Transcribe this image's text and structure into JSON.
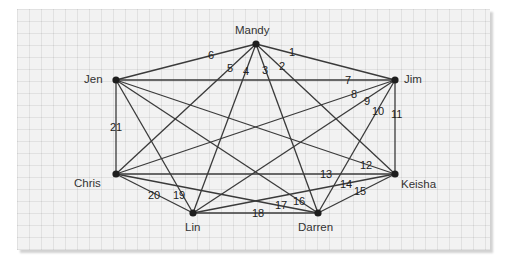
{
  "diagram": {
    "type": "weighted-complete-graph",
    "nodes": [
      {
        "id": "mandy",
        "label": "Mandy",
        "x": 256,
        "y": 44,
        "lx": 235,
        "ly": 34
      },
      {
        "id": "jen",
        "label": "Jen",
        "x": 116,
        "y": 80,
        "lx": 84,
        "ly": 83
      },
      {
        "id": "jim",
        "label": "Jim",
        "x": 395,
        "y": 80,
        "lx": 404,
        "ly": 83
      },
      {
        "id": "chris",
        "label": "Chris",
        "x": 116,
        "y": 174,
        "lx": 74,
        "ly": 187
      },
      {
        "id": "keisha",
        "label": "Keisha",
        "x": 395,
        "y": 174,
        "lx": 401,
        "ly": 188
      },
      {
        "id": "lin",
        "label": "Lin",
        "x": 193,
        "y": 213,
        "lx": 185,
        "ly": 231
      },
      {
        "id": "darren",
        "label": "Darren",
        "x": 318,
        "y": 213,
        "lx": 298,
        "ly": 231
      }
    ],
    "edges": [
      {
        "label": "1",
        "from": "mandy",
        "to": "jim",
        "lx": 289,
        "ly": 56
      },
      {
        "label": "2",
        "from": "mandy",
        "to": "keisha",
        "lx": 279,
        "ly": 70
      },
      {
        "label": "3",
        "from": "mandy",
        "to": "darren",
        "lx": 262,
        "ly": 74
      },
      {
        "label": "4",
        "from": "mandy",
        "to": "lin",
        "lx": 243,
        "ly": 75
      },
      {
        "label": "5",
        "from": "mandy",
        "to": "chris",
        "lx": 227,
        "ly": 72
      },
      {
        "label": "6",
        "from": "mandy",
        "to": "jen",
        "lx": 208,
        "ly": 59
      },
      {
        "label": "7",
        "from": "jen",
        "to": "jim",
        "lx": 345,
        "ly": 84
      },
      {
        "label": "8",
        "from": "jim",
        "to": "chris",
        "lx": 351,
        "ly": 98
      },
      {
        "label": "9",
        "from": "jim",
        "to": "lin",
        "lx": 364,
        "ly": 105
      },
      {
        "label": "10",
        "from": "jim",
        "to": "darren",
        "lx": 372,
        "ly": 115
      },
      {
        "label": "11",
        "from": "jim",
        "to": "keisha",
        "lx": 391,
        "ly": 118
      },
      {
        "label": "12",
        "from": "jen",
        "to": "keisha",
        "lx": 360,
        "ly": 169
      },
      {
        "label": "13",
        "from": "chris",
        "to": "keisha",
        "lx": 320,
        "ly": 178
      },
      {
        "label": "14",
        "from": "lin",
        "to": "keisha",
        "lx": 340,
        "ly": 188
      },
      {
        "label": "15",
        "from": "darren",
        "to": "keisha",
        "lx": 354,
        "ly": 195
      },
      {
        "label": "16",
        "from": "jen",
        "to": "darren",
        "lx": 293,
        "ly": 205
      },
      {
        "label": "17",
        "from": "chris",
        "to": "darren",
        "lx": 275,
        "ly": 209
      },
      {
        "label": "18",
        "from": "lin",
        "to": "darren",
        "lx": 252,
        "ly": 217
      },
      {
        "label": "19",
        "from": "jen",
        "to": "lin",
        "lx": 173,
        "ly": 199
      },
      {
        "label": "20",
        "from": "chris",
        "to": "lin",
        "lx": 148,
        "ly": 199
      },
      {
        "label": "21",
        "from": "jen",
        "to": "chris",
        "lx": 110,
        "ly": 131
      }
    ]
  }
}
